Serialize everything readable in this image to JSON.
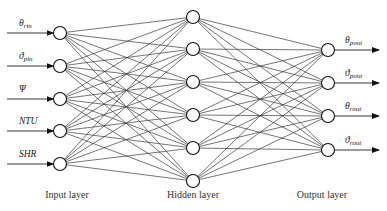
{
  "diagram": {
    "type": "neural-network",
    "layers": [
      {
        "name": "Input layer",
        "x": 60,
        "nodes_y": [
          33,
          66,
          99,
          131,
          164
        ],
        "labels": [
          {
            "main": "θ",
            "sub": "rin"
          },
          {
            "main": "ϑ",
            "sub": "pin"
          },
          {
            "main": "Ψ",
            "sub": ""
          },
          {
            "main": "NTU",
            "sub": ""
          },
          {
            "main": "SHR",
            "sub": ""
          }
        ]
      },
      {
        "name": "Hidden layer",
        "x": 193,
        "nodes_y": [
          17,
          49,
          82,
          115,
          148,
          181
        ]
      },
      {
        "name": "Output layer",
        "x": 328,
        "nodes_y": [
          50,
          83,
          116,
          150
        ],
        "labels": [
          {
            "main": "θ",
            "sub": "pout"
          },
          {
            "main": "ϑ",
            "sub": "pout"
          },
          {
            "main": "θ",
            "sub": "rout"
          },
          {
            "main": "ϑ",
            "sub": "rout"
          }
        ]
      }
    ],
    "layer_labels": {
      "input": "Input layer",
      "hidden": "Hidden layer",
      "output": "Output layer"
    },
    "colors": {
      "edge": "#3a3a3a",
      "node_stroke": "#111111",
      "background": "#ffffff"
    }
  }
}
